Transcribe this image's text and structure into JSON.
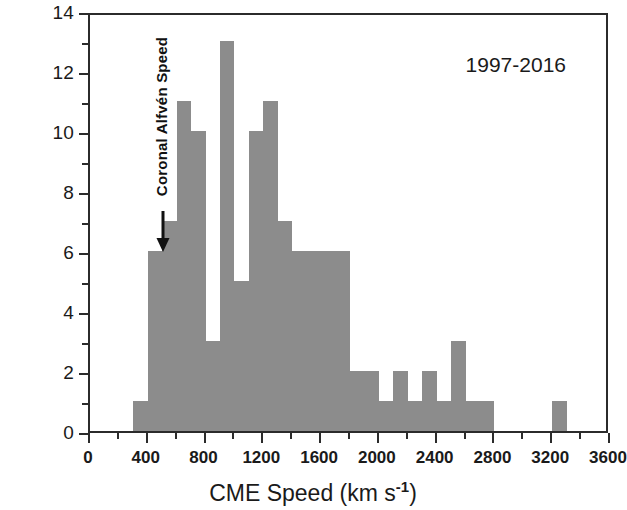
{
  "chart_data": {
    "type": "bar",
    "title": "",
    "subtitle": "",
    "xlabel": "CME Speed (km s-1)",
    "xlabel_base": "CME Speed (km s",
    "xlabel_sup": "-1",
    "xlabel_tail": ")",
    "ylabel": "No. of Events",
    "xlim": [
      0,
      3600
    ],
    "ylim": [
      0,
      14
    ],
    "bin_width": 100,
    "grid": false,
    "legend": null,
    "bar_color": "#8c8c8c",
    "axis_color": "#2b2b2b",
    "x_major_ticks": [
      0,
      400,
      800,
      1200,
      1600,
      2000,
      2400,
      2800,
      3200,
      3600
    ],
    "x_tick_labels": [
      "0",
      "400",
      "800",
      "1200",
      "1600",
      "2000",
      "2400",
      "2800",
      "3200",
      "3600"
    ],
    "x_minor_step": 200,
    "y_major_ticks": [
      0,
      2,
      4,
      6,
      8,
      10,
      12,
      14
    ],
    "y_tick_labels": [
      "0",
      "2",
      "4",
      "6",
      "8",
      "10",
      "12",
      "14"
    ],
    "y_minor_step": 1,
    "bin_edges": [
      300,
      400,
      500,
      600,
      700,
      800,
      900,
      1000,
      1100,
      1200,
      1300,
      1400,
      1500,
      1600,
      1700,
      1800,
      1900,
      2000,
      2100,
      2200,
      2300,
      2400,
      2500,
      2600,
      2700,
      2800,
      2900,
      3000,
      3100,
      3200,
      3300
    ],
    "bin_centers": [
      350,
      450,
      550,
      650,
      750,
      850,
      950,
      1050,
      1150,
      1250,
      1350,
      1450,
      1550,
      1650,
      1750,
      1850,
      1950,
      2050,
      2150,
      2250,
      2350,
      2450,
      2550,
      2650,
      2750,
      2850,
      2950,
      3050,
      3150,
      3250
    ],
    "values": [
      1,
      6,
      7,
      11,
      10,
      3,
      13,
      5,
      10,
      11,
      7,
      6,
      6,
      6,
      6,
      2,
      2,
      1,
      2,
      1,
      2,
      1,
      3,
      1,
      1,
      0,
      0,
      0,
      0,
      1
    ],
    "annotations": [
      {
        "name": "coronal-alfven-speed",
        "text": "Coronal Alfvén Speed",
        "x": 420,
        "orientation": "vertical",
        "arrow": "down"
      },
      {
        "name": "date-range",
        "text": "1997-2016",
        "position": "top-right"
      }
    ]
  }
}
